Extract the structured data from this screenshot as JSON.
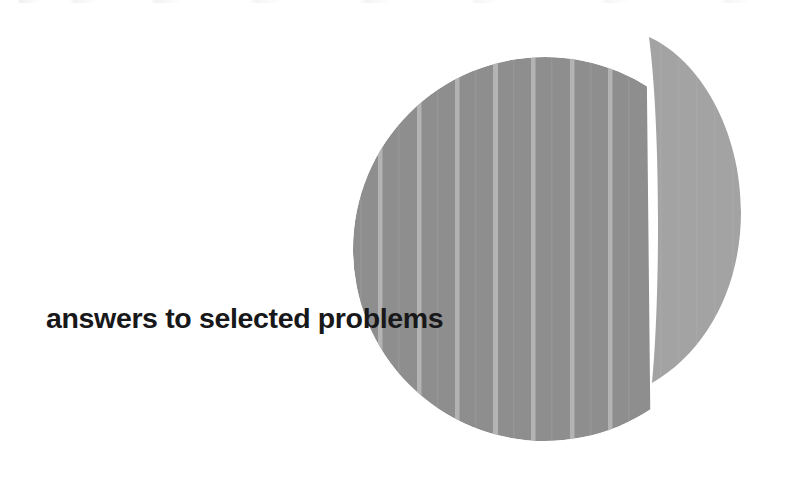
{
  "page": {
    "width": 795,
    "height": 481,
    "background_color": "#ffffff",
    "kind": "book-cover-artwork"
  },
  "title": {
    "text": "answers to selected problems",
    "color": "#18181a",
    "weight": "bold",
    "x": 46,
    "baseline_y": 330
  },
  "artwork": {
    "name": "striped-split-circle",
    "description": "Large gray circle with vertical pinstripes, sliced by a white vertical gap, with a separate gray crescent segment to the right",
    "background_color": "#ffffff",
    "shapes": [
      {
        "name": "left-striped-disc",
        "type": "circle-clipped-left",
        "fill_color": "#8e8e8e",
        "stripe_color": "#b6b6b6",
        "center_x": 545,
        "center_y": 249,
        "radius": 192,
        "clip_right_top_x": 645,
        "clip_right_bottom_x": 649,
        "stripe_xs": [
          380,
          419,
          457,
          495,
          533,
          572,
          610
        ],
        "stripe_width": 4
      },
      {
        "name": "right-crescent",
        "type": "crescent",
        "fill_color": "#a3a3a3",
        "top_tip_x": 649,
        "top_tip_y": 37,
        "bottom_tip_x": 652,
        "bottom_tip_y": 383,
        "max_right_x": 741,
        "max_right_y": 212
      }
    ],
    "gap": {
      "name": "white-vertical-gap",
      "color": "#ffffff",
      "top_x": 646,
      "bottom_x": 651,
      "width": 6
    }
  }
}
